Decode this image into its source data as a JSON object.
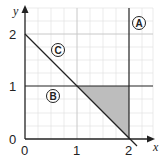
{
  "diagram": {
    "axes": {
      "x_label": "x",
      "y_label": "y",
      "x_ticks": [
        "0",
        "1",
        "2"
      ],
      "y_ticks": [
        "0",
        "1",
        "2"
      ],
      "xlim": [
        0,
        2.3
      ],
      "ylim": [
        0,
        2.4
      ],
      "grid": true,
      "minor_divisions_per_unit": 4
    },
    "lines": [
      {
        "id": "A",
        "label": "A",
        "equation": "x = 2"
      },
      {
        "id": "B",
        "label": "B",
        "equation": "y = 1"
      },
      {
        "id": "C",
        "label": "C",
        "equation": "x + y = 2"
      }
    ],
    "shaded_region": {
      "vertices": [
        [
          1,
          1
        ],
        [
          2,
          1
        ],
        [
          2,
          0
        ]
      ],
      "color": "#bdbdbd"
    },
    "colors": {
      "line": "#222222",
      "grid_major": "#c8c8c8",
      "grid_minor": "#e2e2e2"
    }
  }
}
